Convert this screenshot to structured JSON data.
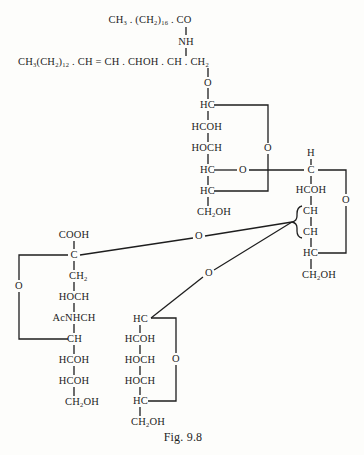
{
  "figure": {
    "caption": "Fig. 9.8"
  },
  "ceramide": {
    "fatty_acid": {
      "a": "CH",
      "a_sub": "3",
      "b": " . (CH",
      "b_sub": "2",
      "c": ")",
      "c_sub": "16",
      "d": " . CO"
    },
    "amide": "NH",
    "sphingosine": {
      "a": "CH",
      "a_sub": "3",
      "b": "(CH",
      "b_sub": "2",
      "c": ")",
      "c_sub": "12",
      "d": " . CH = CH . CHOH . CH . CH",
      "d_sub": "2"
    },
    "link_oxygen": "O"
  },
  "glucose": {
    "atoms": [
      "HC",
      "HCOH",
      "HOCH",
      "HC",
      "HC"
    ],
    "ring_oxygen": "O",
    "glycosidic_oxygen": "O",
    "terminal": {
      "a": "CH",
      "a_sub": "2",
      "b": "OH"
    }
  },
  "galactose_upper": {
    "top_h": "H",
    "atoms": [
      "C",
      "HCOH",
      "CH",
      "CH",
      "HC"
    ],
    "ring_oxygen": "O",
    "terminal": {
      "a": "CH",
      "a_sub": "2",
      "b": "OH"
    }
  },
  "linkages": {
    "sialic_link_oxygen": "O",
    "galactose_link_oxygen": "O"
  },
  "sialic_acid": {
    "atoms": [
      "COOH",
      "C",
      "CH₂",
      "HOCH",
      "AcNHCH",
      "CH",
      "HCOH",
      "HCOH"
    ],
    "ch2": {
      "a": "CH",
      "a_sub": "2"
    },
    "ring_oxygen": "O",
    "terminal": {
      "a": "CH",
      "a_sub": "2",
      "b": "OH"
    }
  },
  "galactose_lower": {
    "atoms": [
      "HC",
      "HCOH",
      "HOCH",
      "HOCH",
      "HC"
    ],
    "ring_oxygen": "O",
    "terminal": {
      "a": "CH",
      "a_sub": "2",
      "b": "OH"
    }
  }
}
